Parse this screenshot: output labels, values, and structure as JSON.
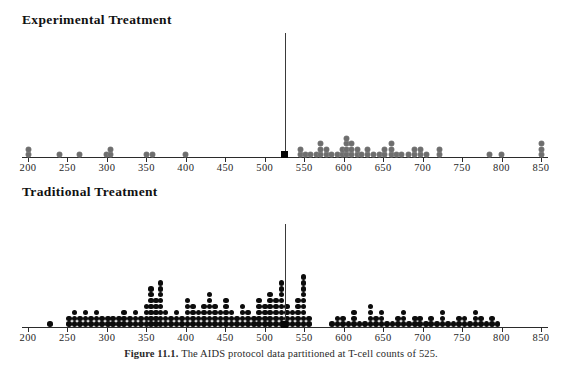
{
  "figure": {
    "caption_lead": "Figure 11.1.",
    "caption_body": "The AIDS protocol data partitioned at T-cell counts of 525.",
    "caption_full": "Figure 11.1. The AIDS protocol data partitioned at T-cell counts of 525.",
    "partition_value": 525,
    "colors": {
      "experimental_dot": "#6e6e6e",
      "traditional_dot": "#0c0c0c",
      "axis": "#2b2b2b",
      "split_line": "#3a3a3a",
      "background": "#ffffff"
    }
  },
  "panels": [
    {
      "id": "experimental",
      "title": "Experimental Treatment"
    },
    {
      "id": "traditional",
      "title": "Traditional Treatment"
    }
  ],
  "chart_data": [
    {
      "type": "scatter",
      "subtype": "dot-plot",
      "title": "Experimental Treatment",
      "xlabel": "T-cell count",
      "ylabel": "",
      "xlim": [
        200,
        850
      ],
      "ticks": [
        200,
        250,
        300,
        350,
        400,
        450,
        500,
        550,
        600,
        650,
        700,
        750,
        800,
        850
      ],
      "grid": false,
      "legend": null,
      "annotations": [
        {
          "kind": "vertical-line",
          "x": 525,
          "label": "partition at 525"
        },
        {
          "kind": "square-marker",
          "x": 525,
          "y": 0
        }
      ],
      "note": "each entry is [x_value, stack_count]",
      "stacks": [
        [
          200,
          2
        ],
        [
          240,
          1
        ],
        [
          265,
          1
        ],
        [
          300,
          1
        ],
        [
          305,
          2
        ],
        [
          350,
          1
        ],
        [
          358,
          1
        ],
        [
          400,
          1
        ],
        [
          525,
          1
        ],
        [
          545,
          2
        ],
        [
          552,
          1
        ],
        [
          558,
          1
        ],
        [
          565,
          1
        ],
        [
          570,
          3
        ],
        [
          578,
          2
        ],
        [
          585,
          1
        ],
        [
          592,
          1
        ],
        [
          598,
          2
        ],
        [
          603,
          4
        ],
        [
          610,
          3
        ],
        [
          617,
          2
        ],
        [
          623,
          1
        ],
        [
          630,
          2
        ],
        [
          638,
          1
        ],
        [
          645,
          1
        ],
        [
          652,
          2
        ],
        [
          660,
          3
        ],
        [
          667,
          1
        ],
        [
          673,
          1
        ],
        [
          682,
          1
        ],
        [
          690,
          2
        ],
        [
          697,
          2
        ],
        [
          705,
          1
        ],
        [
          722,
          2
        ],
        [
          785,
          1
        ],
        [
          800,
          1
        ],
        [
          850,
          3
        ]
      ]
    },
    {
      "type": "scatter",
      "subtype": "dot-plot",
      "title": "Traditional Treatment",
      "xlabel": "T-cell count",
      "ylabel": "",
      "xlim": [
        200,
        850
      ],
      "ticks": [
        200,
        250,
        300,
        350,
        400,
        450,
        500,
        550,
        600,
        650,
        700,
        750,
        800,
        850
      ],
      "grid": false,
      "legend": null,
      "annotations": [
        {
          "kind": "vertical-line",
          "x": 525,
          "label": "partition at 525"
        },
        {
          "kind": "square-marker",
          "x": 525,
          "y": 0
        }
      ],
      "note": "each entry is [x_value, stack_count]",
      "stacks": [
        [
          228,
          1
        ],
        [
          252,
          2
        ],
        [
          259,
          3
        ],
        [
          266,
          2
        ],
        [
          273,
          3
        ],
        [
          280,
          2
        ],
        [
          287,
          3
        ],
        [
          294,
          2
        ],
        [
          301,
          2
        ],
        [
          308,
          2
        ],
        [
          315,
          2
        ],
        [
          322,
          3
        ],
        [
          329,
          2
        ],
        [
          336,
          3
        ],
        [
          343,
          2
        ],
        [
          350,
          4
        ],
        [
          356,
          7
        ],
        [
          362,
          5
        ],
        [
          368,
          8
        ],
        [
          374,
          3
        ],
        [
          381,
          2
        ],
        [
          388,
          3
        ],
        [
          395,
          2
        ],
        [
          402,
          5
        ],
        [
          409,
          4
        ],
        [
          416,
          3
        ],
        [
          423,
          4
        ],
        [
          430,
          6
        ],
        [
          437,
          4
        ],
        [
          444,
          3
        ],
        [
          451,
          5
        ],
        [
          458,
          3
        ],
        [
          465,
          2
        ],
        [
          472,
          4
        ],
        [
          479,
          3
        ],
        [
          486,
          2
        ],
        [
          493,
          5
        ],
        [
          500,
          4
        ],
        [
          507,
          6
        ],
        [
          514,
          5
        ],
        [
          521,
          8
        ],
        [
          528,
          4
        ],
        [
          535,
          3
        ],
        [
          542,
          5
        ],
        [
          549,
          9
        ],
        [
          556,
          2
        ],
        [
          585,
          1
        ],
        [
          592,
          2
        ],
        [
          599,
          2
        ],
        [
          606,
          1
        ],
        [
          613,
          3
        ],
        [
          620,
          1
        ],
        [
          627,
          1
        ],
        [
          634,
          4
        ],
        [
          641,
          2
        ],
        [
          648,
          3
        ],
        [
          655,
          1
        ],
        [
          662,
          1
        ],
        [
          669,
          2
        ],
        [
          676,
          3
        ],
        [
          683,
          1
        ],
        [
          690,
          2
        ],
        [
          697,
          2
        ],
        [
          704,
          1
        ],
        [
          711,
          2
        ],
        [
          718,
          1
        ],
        [
          725,
          3
        ],
        [
          732,
          1
        ],
        [
          739,
          1
        ],
        [
          746,
          2
        ],
        [
          753,
          2
        ],
        [
          760,
          1
        ],
        [
          767,
          3
        ],
        [
          774,
          2
        ],
        [
          781,
          1
        ],
        [
          788,
          2
        ],
        [
          795,
          1
        ]
      ]
    }
  ]
}
